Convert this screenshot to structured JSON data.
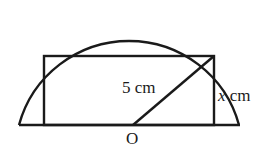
{
  "diagram": {
    "labels": {
      "radius": "5 cm",
      "height_var": "x",
      "height_unit": " cm",
      "centre": "O"
    },
    "stroke_color": "#1a1a1a"
  }
}
